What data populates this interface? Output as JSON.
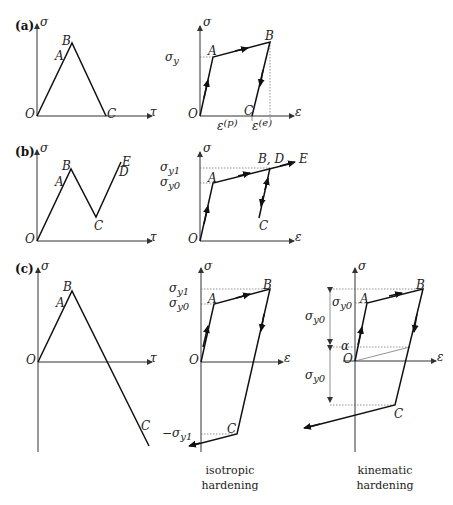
{
  "panels": {
    "a": {
      "label": "(a)",
      "left": {
        "y_axis": "σ",
        "x_axis": "τ",
        "points": {
          "O": "O",
          "A": "A",
          "B": "B",
          "C": "C"
        }
      },
      "right": {
        "y_axis": "σ",
        "x_axis": "ε",
        "points": {
          "O": "O",
          "A": "A",
          "B": "B",
          "C": "C"
        },
        "sigma_y": "σ",
        "sigma_y_sub": "y",
        "eps_p": "ε",
        "eps_p_sup": "(p)",
        "eps_e": "ε",
        "eps_e_sup": "(e)"
      }
    },
    "b": {
      "label": "(b)",
      "left": {
        "y_axis": "σ",
        "x_axis": "τ",
        "points": {
          "O": "O",
          "A": "A",
          "B": "B",
          "C": "C",
          "D": "D",
          "E": "E"
        }
      },
      "right": {
        "y_axis": "σ",
        "x_axis": "ε",
        "points": {
          "O": "O",
          "A": "A",
          "BD": "B, D",
          "C": "C",
          "E": "E"
        },
        "sigma_y1": "σ",
        "sigma_y1_sub": "y1",
        "sigma_y0": "σ",
        "sigma_y0_sub": "y0"
      }
    },
    "c": {
      "label": "(c)",
      "left": {
        "y_axis": "σ",
        "x_axis": "τ",
        "points": {
          "O": "O",
          "A": "A",
          "B": "B",
          "C": "C"
        }
      },
      "middle": {
        "y_axis": "σ",
        "x_axis": "ε",
        "points": {
          "O": "O",
          "A": "A",
          "B": "B",
          "C": "C"
        },
        "sigma_y1": "σ",
        "sigma_y1_sub": "y1",
        "sigma_y0": "σ",
        "sigma_y0_sub": "y0",
        "neg_sigma_y1": "−σ",
        "neg_sigma_y1_sub": "y1",
        "caption_line1": "isotropic",
        "caption_line2": "hardening"
      },
      "right": {
        "y_axis": "σ",
        "x_axis": "ε",
        "points": {
          "O": "O",
          "A": "A",
          "B": "B",
          "C": "C"
        },
        "sigma_y0": "σ",
        "sigma_y0_sub": "y0",
        "alpha": "α",
        "dim_upper": "σ",
        "dim_upper_sub": "y0",
        "dim_lower": "σ",
        "dim_lower_sub": "y0",
        "caption_line1": "kinematic",
        "caption_line2": "hardening"
      }
    }
  }
}
